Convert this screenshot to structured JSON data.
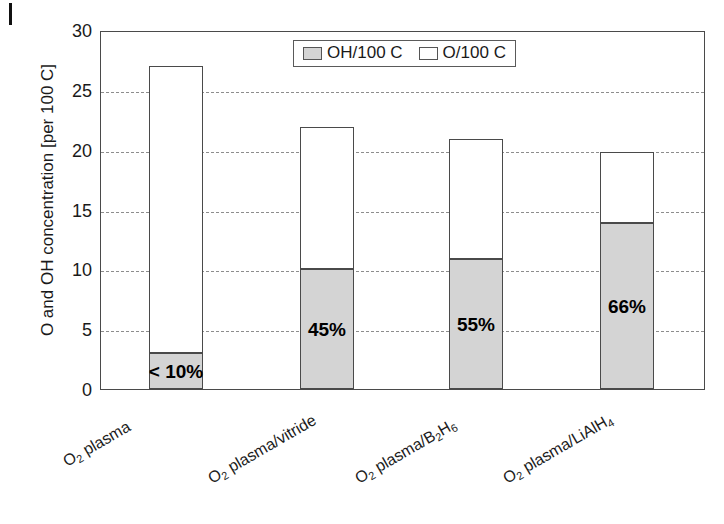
{
  "chart_data": {
    "type": "bar",
    "subtype": "stacked-bar",
    "title": "",
    "xlabel": "",
    "ylabel": "O and OH concentration [per 100 C]",
    "ylim": [
      0,
      30
    ],
    "yticks": [
      0,
      5,
      10,
      15,
      20,
      25,
      30
    ],
    "ytick_labels": [
      "0",
      "5",
      "10",
      "15",
      "20",
      "25",
      "30"
    ],
    "grid": "horizontal-dashed",
    "legend_position": "top-center-inside",
    "categories": [
      "O2 plasma",
      "O2 plasma/vitride",
      "O2 plasma/B2H6",
      "O2 plasma/LiAlH4"
    ],
    "category_labels_html": [
      "O₂ plasma",
      "O₂ plasma/vitride",
      "O₂ plasma/B₂H₆",
      "O₂ plasma/LiAlH₄"
    ],
    "series": [
      {
        "name": "OH/100 C",
        "color": "#d4d4d4",
        "values": [
          3.0,
          10.0,
          10.9,
          13.9
        ]
      },
      {
        "name": "O/100 C",
        "color": "#ffffff",
        "values": [
          24.0,
          11.9,
          10.0,
          5.9
        ]
      }
    ],
    "totals": [
      27.0,
      21.9,
      20.9,
      19.8
    ],
    "annotations": [
      "< 10%",
      "45%",
      "55%",
      "66%"
    ]
  },
  "legend": {
    "items": [
      {
        "label": "OH/100 C",
        "swatch": "gray-swatch-icon"
      },
      {
        "label": "O/100 C",
        "swatch": "white-swatch-icon"
      }
    ]
  },
  "axes": {
    "y_title": "O and OH concentration [per 100 C]",
    "y_tick_labels": [
      "30",
      "25",
      "20",
      "15",
      "10",
      "5",
      "0"
    ]
  },
  "colors": {
    "oh_fill": "#d4d4d4",
    "o_fill": "#ffffff",
    "axis": "#4a4a4a",
    "grid": "#8d8d8d",
    "text": "#1a1a1a"
  }
}
